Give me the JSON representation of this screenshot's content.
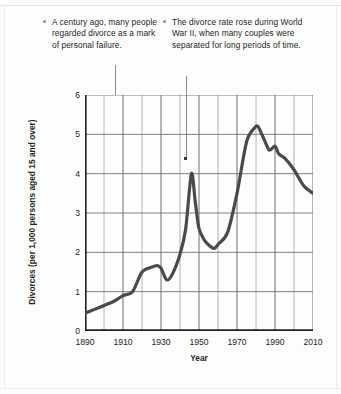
{
  "chart_data": {
    "type": "line",
    "title": "",
    "xlabel": "Year",
    "ylabel": "Divorces (per 1,000 persons aged 15 and over)",
    "xlim": [
      1890,
      2010
    ],
    "ylim": [
      0,
      6
    ],
    "ytick_labels": [
      "0",
      "1",
      "2",
      "3",
      "4",
      "5",
      "6"
    ],
    "ytick_values": [
      0,
      1,
      2,
      3,
      4,
      5,
      6
    ],
    "xtick_labels": [
      "1890",
      "1910",
      "1930",
      "1950",
      "1970",
      "1990",
      "2010"
    ],
    "xtick_values": [
      1890,
      1910,
      1930,
      1950,
      1970,
      1990,
      2010
    ],
    "xminor_step": 10,
    "grid": true,
    "legend": "none",
    "line_color": "#4a4a4a",
    "line_width": 3.2,
    "series": [
      {
        "name": "Divorce rate",
        "x": [
          1890,
          1895,
          1900,
          1905,
          1910,
          1915,
          1920,
          1925,
          1928,
          1930,
          1933,
          1936,
          1940,
          1943,
          1946,
          1948,
          1950,
          1953,
          1956,
          1958,
          1960,
          1965,
          1970,
          1975,
          1979,
          1981,
          1984,
          1987,
          1990,
          1992,
          1995,
          2000,
          2005,
          2010
        ],
        "values": [
          0.45,
          0.55,
          0.65,
          0.75,
          0.9,
          1.0,
          1.5,
          1.62,
          1.66,
          1.6,
          1.3,
          1.45,
          1.95,
          2.6,
          4.0,
          3.3,
          2.6,
          2.3,
          2.15,
          2.1,
          2.2,
          2.5,
          3.5,
          4.8,
          5.15,
          5.2,
          4.9,
          4.6,
          4.7,
          4.5,
          4.4,
          4.1,
          3.7,
          3.5
        ]
      }
    ],
    "annotations": [
      {
        "id": "annotation-1",
        "text": "A century ago, many people regarded divorce as a mark of personal failure.",
        "bullet": "bullet-marker",
        "target_x": 1905
      },
      {
        "id": "annotation-2",
        "text": "The divorce rate rose during World War II, when many couples were separated for long periods of time.",
        "bullet": "bullet-marker",
        "target_x": 1943,
        "target_y": 4.3
      }
    ]
  },
  "colors": {
    "line": "#4a4a4a",
    "axis": "#231f20",
    "grid": "#7d7d7d",
    "bullet": "#8e8e8e",
    "background": "#fdfdfd"
  }
}
